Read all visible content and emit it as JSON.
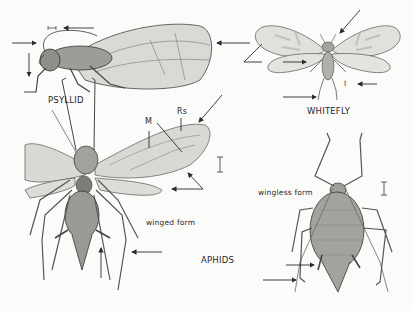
{
  "figure": {
    "subjects": [
      {
        "name": "psyllid",
        "label": "PSYLLID"
      },
      {
        "name": "whitefly",
        "label": "WHITEFLY"
      },
      {
        "name": "aphids",
        "label": "APHIDS",
        "forms": [
          {
            "name": "winged",
            "label": "winged form"
          },
          {
            "name": "wingless",
            "label": "wingless form"
          }
        ],
        "vein_labels": {
          "m": "M",
          "rs": "Rs"
        }
      }
    ],
    "scale_bar_glyph": "I",
    "colors": {
      "background": "#fbfbfa",
      "ink": "#2b2b2b",
      "body_fill": "#9a9a96",
      "wing_fill": "#d6d6d2"
    }
  }
}
